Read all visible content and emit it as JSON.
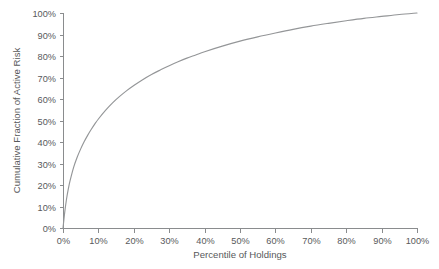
{
  "chart_data": {
    "type": "line",
    "title": "",
    "subtitle": "",
    "xlabel": "Percentile of Holdings",
    "ylabel": "Cumulative Fraction of Active Risk",
    "xlim": [
      0,
      100
    ],
    "ylim": [
      0,
      100
    ],
    "grid": false,
    "legend": null,
    "legend_position": "none",
    "x_tick_labels": [
      "0%",
      "10%",
      "20%",
      "30%",
      "40%",
      "50%",
      "60%",
      "70%",
      "80%",
      "90%",
      "100%"
    ],
    "x_tick_values": [
      0,
      10,
      20,
      30,
      40,
      50,
      60,
      70,
      80,
      90,
      100
    ],
    "y_tick_labels": [
      "0%",
      "10%",
      "20%",
      "30%",
      "40%",
      "50%",
      "60%",
      "70%",
      "80%",
      "90%",
      "100%"
    ],
    "y_tick_values": [
      0,
      10,
      20,
      30,
      40,
      50,
      60,
      70,
      80,
      90,
      100
    ],
    "series": [
      {
        "name": "Cumulative Fraction of Active Risk",
        "color": "#949698",
        "x": [
          0,
          0.5,
          1,
          1.5,
          2,
          3,
          4,
          5,
          6,
          7,
          8,
          9,
          10,
          12,
          14,
          16,
          18,
          20,
          22.5,
          25,
          27.5,
          30,
          32.5,
          35,
          37.5,
          40,
          45,
          50,
          55,
          60,
          65,
          70,
          75,
          80,
          85,
          90,
          95,
          100
        ],
        "y": [
          0,
          7.5,
          13.5,
          18.2,
          22.0,
          28.2,
          32.9,
          36.8,
          40.2,
          43.2,
          45.9,
          48.4,
          50.7,
          54.7,
          58.2,
          61.2,
          63.9,
          66.3,
          69.0,
          71.4,
          73.5,
          75.5,
          77.3,
          79.0,
          80.5,
          82.0,
          84.6,
          86.9,
          88.9,
          90.7,
          92.4,
          93.9,
          95.2,
          96.4,
          97.5,
          98.4,
          99.3,
          100
        ]
      }
    ]
  },
  "plot_geometry": {
    "left": 63,
    "right": 417,
    "top": 13,
    "bottom": 228
  }
}
